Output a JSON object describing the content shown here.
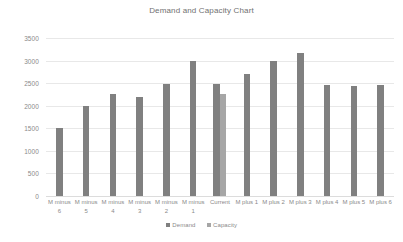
{
  "chart_data": {
    "type": "bar",
    "title": "Demand and Capacity Chart",
    "xlabel": "",
    "ylabel": "",
    "ylim": [
      0,
      3500
    ],
    "y_ticks": [
      0,
      500,
      1000,
      1500,
      2000,
      2500,
      3000,
      3500
    ],
    "y_tick_labels": [
      "0",
      "500",
      "1000",
      "1500",
      "2000",
      "2500",
      "3000",
      "3500"
    ],
    "grid": true,
    "legend_position": "bottom-center",
    "categories": [
      "M minus 6",
      "M minus 5",
      "M minus 4",
      "M minus 3",
      "M minus 2",
      "M minus 1",
      "Current",
      "M plus 1",
      "M plus 2",
      "M plus 3",
      "M plus 4",
      "M plus 5",
      "M plus 6"
    ],
    "category_lines": [
      [
        "M minus",
        "6"
      ],
      [
        "M minus",
        "5"
      ],
      [
        "M minus",
        "4"
      ],
      [
        "M minus",
        "3"
      ],
      [
        "M minus",
        "2"
      ],
      [
        "M minus",
        "1"
      ],
      [
        "Current",
        ""
      ],
      [
        "M plus 1",
        ""
      ],
      [
        "M plus 2",
        ""
      ],
      [
        "M plus 3",
        ""
      ],
      [
        "M plus 4",
        ""
      ],
      [
        "M plus 5",
        ""
      ],
      [
        "M plus 6",
        ""
      ]
    ],
    "series": [
      {
        "name": "Demand",
        "color": "#808080",
        "values": [
          1500,
          2000,
          2270,
          2190,
          2480,
          3000,
          2480,
          2700,
          2990,
          3170,
          2470,
          2430,
          2470
        ]
      },
      {
        "name": "Capacity",
        "color": "#a6a6a6",
        "values": [
          null,
          null,
          null,
          null,
          null,
          null,
          2270,
          null,
          null,
          null,
          null,
          null,
          null
        ]
      }
    ]
  },
  "legend": {
    "items": [
      {
        "label": "Demand"
      },
      {
        "label": "Capacity"
      }
    ]
  },
  "colors": {
    "demand": "#808080",
    "capacity": "#a6a6a6",
    "gridline": "#e8e8e8",
    "text": "#8a8a8a",
    "title_text": "#707070",
    "background": "#ffffff"
  }
}
